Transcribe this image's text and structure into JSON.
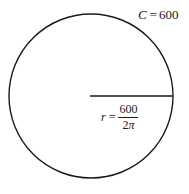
{
  "figure": {
    "background_color": "#ffffff",
    "stroke_color": "#1a1a1a",
    "circle": {
      "center_x": 91,
      "center_y": 96,
      "radius": 82,
      "stroke_width": 1.4
    },
    "radius_line": {
      "x1": 90,
      "y1": 96,
      "x2": 173,
      "y2": 96,
      "stroke_width": 1.6
    }
  },
  "labels": {
    "circumference": {
      "variable": "C",
      "equals": "=",
      "value": "600",
      "full_text": "C = 600"
    },
    "radius": {
      "variable": "r",
      "equals": "=",
      "numerator": "600",
      "denominator_coefficient": "2",
      "denominator_symbol": "π",
      "full_text": "r = 600/(2π)"
    }
  }
}
